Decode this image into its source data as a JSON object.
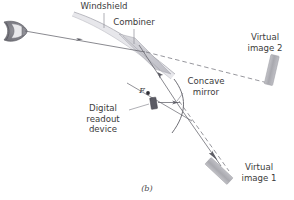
{
  "figure": {
    "caption": "(b)",
    "caption_x": 0,
    "caption_y": 183,
    "width": 294,
    "height": 200,
    "background": "#ffffff",
    "type": "optics-ray-diagram"
  },
  "colors": {
    "line": "#6e6e75",
    "line_dark": "#4a4a52",
    "text": "#3b3b3b",
    "glass": "#c9c9cf",
    "glass_light": "#dedee3",
    "image_block": "#b3b3b8",
    "device": "#555560",
    "eye": "#8a8a90",
    "dashed": "#7a7a82"
  },
  "labels": [
    {
      "name": "windshield",
      "text": "Windshield",
      "x": 72,
      "y": 2,
      "w": 64,
      "align": "c"
    },
    {
      "name": "combiner",
      "text": "Combiner",
      "x": 105,
      "y": 18,
      "w": 58,
      "align": "c"
    },
    {
      "name": "virtual-image-2",
      "text": "Virtual\nimage 2",
      "x": 238,
      "y": 33,
      "w": 54,
      "align": "c"
    },
    {
      "name": "concave-mirror",
      "text": "Concave\nmirror",
      "x": 178,
      "y": 77,
      "w": 56,
      "align": "c"
    },
    {
      "name": "digital-readout",
      "text": "Digital\nreadout\ndevice",
      "x": 77,
      "y": 104,
      "w": 52,
      "align": "c"
    },
    {
      "name": "virtual-image-1",
      "text": "Virtual\nimage 1",
      "x": 233,
      "y": 163,
      "w": 52,
      "align": "c"
    },
    {
      "name": "focal-point-f",
      "text": "F",
      "x": 140,
      "y": 97,
      "w": 10,
      "align": "c",
      "italic": true
    }
  ],
  "geometry": {
    "eye": {
      "cx": 13,
      "cy": 31,
      "rx": 12,
      "ry": 9,
      "note": "side-view eye at upper-left"
    },
    "windshield_curve": "M 74,12 C 104,22 132,38 175,74",
    "combiner_plate": "M 118,34 L 137,39 L 169,70 L 150,62 Z",
    "combiner_leader": {
      "x1": 134,
      "y1": 28,
      "x2": 134,
      "y2": 42
    },
    "windshield_leader": {
      "x1": 104,
      "y1": 12,
      "x2": 104,
      "y2": 27
    },
    "mirror_arc": "M 174,79 C 186,96 186,112 173,132",
    "device_rect": {
      "x": 151,
      "y": 98,
      "w": 6,
      "h": 11,
      "rot": -8
    },
    "focal_dot": {
      "cx": 148,
      "cy": 93,
      "r": 1.8
    },
    "virtual_image_2_rect": {
      "cx": 272,
      "cy": 70,
      "w": 8,
      "h": 28,
      "rot": 12
    },
    "virtual_image_1_rect": {
      "cx": 219,
      "cy": 171,
      "w": 9,
      "h": 30,
      "rot": -48
    },
    "rays": [
      {
        "name": "eye-to-combiner",
        "d": "M 24,31 L 145,52",
        "style": "solid",
        "arrow_at": 0.55
      },
      {
        "name": "combiner-to-virtual-2",
        "d": "M 145,52 L 270,83",
        "style": "dashed"
      },
      {
        "name": "mirror-to-combiner",
        "d": "M 178,105 L 138,44",
        "style": "solid",
        "arrow_at": 0.52
      },
      {
        "name": "device-to-mirror",
        "d": "M 157,103 L 178,103",
        "style": "solid",
        "arrow_at": 0.8
      },
      {
        "name": "mirror-to-virtual-1",
        "d": "M 178,105 L 222,167",
        "style": "solid",
        "arrow_at": 0.88
      },
      {
        "name": "virtual-1-dashed",
        "d": "M 178,101 L 228,172",
        "style": "dashed"
      },
      {
        "name": "axis-through-f",
        "d": "M 128,84 L 190,120",
        "style": "solid"
      },
      {
        "name": "readout-leader",
        "d": "M 131,110 L 149,104",
        "style": "solid"
      },
      {
        "name": "concave-leader",
        "d": "M 181,92 L 176,101",
        "style": "solid"
      }
    ]
  }
}
